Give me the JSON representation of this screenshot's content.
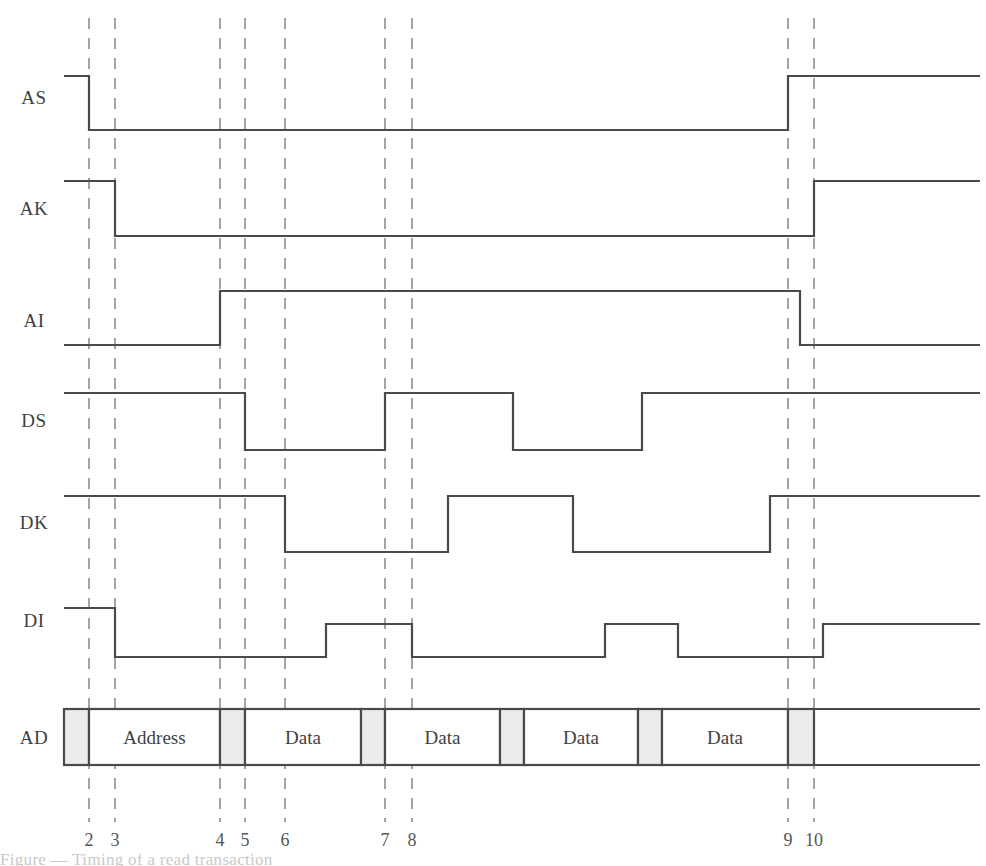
{
  "figure": {
    "kind": "timing-diagram",
    "title": "",
    "background_color": "#ffffff",
    "wave_color": "#4a4a4a",
    "grid_color": "#8e8e8e",
    "bus_fill_color": "#ffffff",
    "bus_gap_color": "#ececec",
    "partial_caption": "Figure — Timing of a read transaction"
  },
  "axis": {
    "label": "",
    "ticks": [
      {
        "label": "2",
        "x": 89
      },
      {
        "label": "3",
        "x": 115
      },
      {
        "label": "4",
        "x": 220
      },
      {
        "label": "5",
        "x": 245
      },
      {
        "label": "6",
        "x": 285
      },
      {
        "label": "7",
        "x": 385
      },
      {
        "label": "8",
        "x": 412
      },
      {
        "label": "9",
        "x": 788
      },
      {
        "label": "10",
        "x": 814
      }
    ]
  },
  "signals": [
    {
      "name": "AS",
      "label": "AS",
      "row_y": 97,
      "high_y": 76,
      "low_y": 130,
      "description": "Address Strobe: high, falls at 2, low through transaction, rises at 9",
      "transitions": [
        {
          "x": 64,
          "level": "high"
        },
        {
          "x": 89,
          "level": "low"
        },
        {
          "x": 788,
          "level": "high"
        },
        {
          "x": 980,
          "level": "high"
        }
      ]
    },
    {
      "name": "AK",
      "label": "AK",
      "row_y": 208,
      "high_y": 181,
      "low_y": 236,
      "description": "Address Acknowledge: high, falls at 3, rises at 10",
      "transitions": [
        {
          "x": 64,
          "level": "high"
        },
        {
          "x": 115,
          "level": "low"
        },
        {
          "x": 814,
          "level": "high"
        },
        {
          "x": 980,
          "level": "high"
        }
      ]
    },
    {
      "name": "AI",
      "label": "AI",
      "row_y": 320,
      "high_y": 291,
      "low_y": 345,
      "description": "Address Information valid: low, rises at 4, falls just after 9",
      "transitions": [
        {
          "x": 64,
          "level": "low"
        },
        {
          "x": 220,
          "level": "high"
        },
        {
          "x": 800,
          "level": "low"
        },
        {
          "x": 980,
          "level": "low"
        }
      ]
    },
    {
      "name": "DS",
      "label": "DS",
      "row_y": 420,
      "high_y": 393,
      "low_y": 450,
      "description": "Data Strobe: high, low from 5 to 7, high, low mid-burst, high from 9 onward",
      "transitions": [
        {
          "x": 64,
          "level": "high"
        },
        {
          "x": 245,
          "level": "low"
        },
        {
          "x": 385,
          "level": "high"
        },
        {
          "x": 513,
          "level": "low"
        },
        {
          "x": 642,
          "level": "high"
        },
        {
          "x": 980,
          "level": "high"
        }
      ]
    },
    {
      "name": "DK",
      "label": "DK",
      "row_y": 522,
      "high_y": 496,
      "low_y": 552,
      "description": "Data Acknowledge: high, falls at 6, rises mid-burst, falls, rises before 9",
      "transitions": [
        {
          "x": 64,
          "level": "high"
        },
        {
          "x": 285,
          "level": "low"
        },
        {
          "x": 448,
          "level": "high"
        },
        {
          "x": 573,
          "level": "low"
        },
        {
          "x": 770,
          "level": "high"
        },
        {
          "x": 980,
          "level": "high"
        }
      ]
    },
    {
      "name": "DI",
      "label": "DI",
      "row_y": 620,
      "high_y": 608,
      "mid_y": 624,
      "low_y": 657,
      "description": "Data Information valid: high, falls at 3, pulses high between 7 and 8, pulses again, rises after 10",
      "transitions": [
        {
          "x": 64,
          "level": "high"
        },
        {
          "x": 115,
          "level": "low"
        },
        {
          "x": 326,
          "level": "mid"
        },
        {
          "x": 412,
          "level": "low"
        },
        {
          "x": 605,
          "level": "mid"
        },
        {
          "x": 678,
          "level": "low"
        },
        {
          "x": 823,
          "level": "mid"
        },
        {
          "x": 980,
          "level": "mid"
        }
      ]
    }
  ],
  "bus": {
    "name": "AD",
    "label": "AD",
    "row_y": 737,
    "top_y": 709,
    "bottom_y": 765,
    "start_x": 64,
    "end_x": 980,
    "cells": [
      {
        "type": "gap",
        "label": "",
        "x0": 64,
        "x1": 89
      },
      {
        "type": "data",
        "label": "Address",
        "x0": 89,
        "x1": 220
      },
      {
        "type": "gap",
        "label": "",
        "x0": 220,
        "x1": 245
      },
      {
        "type": "data",
        "label": "Data",
        "x0": 245,
        "x1": 361
      },
      {
        "type": "gap",
        "label": "",
        "x0": 361,
        "x1": 385
      },
      {
        "type": "data",
        "label": "Data",
        "x0": 385,
        "x1": 500
      },
      {
        "type": "gap",
        "label": "",
        "x0": 500,
        "x1": 524
      },
      {
        "type": "data",
        "label": "Data",
        "x0": 524,
        "x1": 638
      },
      {
        "type": "gap",
        "label": "",
        "x0": 638,
        "x1": 662
      },
      {
        "type": "data",
        "label": "Data",
        "x0": 662,
        "x1": 788
      },
      {
        "type": "gap",
        "label": "",
        "x0": 788,
        "x1": 814
      }
    ]
  },
  "geometry": {
    "label_x": 34,
    "grid_top": 18,
    "grid_bottom": 822,
    "tick_label_y": 846,
    "canvas_width": 986,
    "canvas_height": 866
  }
}
